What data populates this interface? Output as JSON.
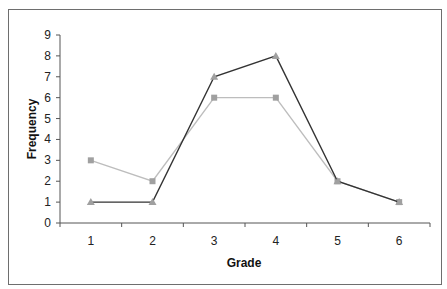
{
  "chart_data": {
    "type": "line",
    "title": "",
    "xlabel": "Grade",
    "ylabel": "Frequency",
    "categories": [
      "1",
      "2",
      "3",
      "4",
      "5",
      "6"
    ],
    "ylim": [
      0,
      9
    ],
    "yticks": [
      "0",
      "1",
      "2",
      "3",
      "4",
      "5",
      "6",
      "7",
      "8",
      "9"
    ],
    "grid": false,
    "legend": "none",
    "series": [
      {
        "name": "Series A",
        "marker": "triangle",
        "line_color": "#333333",
        "marker_color": "#a0a0a0",
        "values": [
          1,
          1,
          7,
          8,
          2,
          1
        ]
      },
      {
        "name": "Series B",
        "marker": "square",
        "line_color": "#bdbdbd",
        "marker_color": "#a0a0a0",
        "values": [
          3,
          2,
          6,
          6,
          2,
          1
        ]
      }
    ]
  },
  "axes": {
    "x_title": "Grade",
    "y_title": "Frequency"
  }
}
